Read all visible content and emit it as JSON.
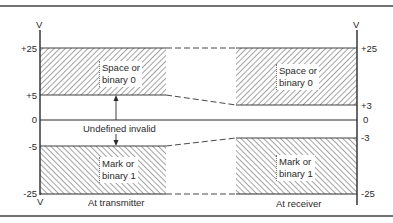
{
  "diagram": {
    "unit_label": "V",
    "transmitter": {
      "caption": "At transmitter",
      "ticks": [
        {
          "label": "+25",
          "value": 25
        },
        {
          "label": "+5",
          "value": 5
        },
        {
          "label": "0",
          "value": 0
        },
        {
          "label": "-5",
          "value": -5
        },
        {
          "label": "-25",
          "value": -25
        }
      ],
      "space_region": {
        "label_line1": "Space or",
        "label_line2": "binary 0",
        "range": [
          5,
          25
        ]
      },
      "mark_region": {
        "label_line1": "Mark or",
        "label_line2": "binary 1",
        "range": [
          -25,
          -5
        ]
      }
    },
    "receiver": {
      "caption": "At receiver",
      "ticks": [
        {
          "label": "+25",
          "value": 25
        },
        {
          "label": "+3",
          "value": 3
        },
        {
          "label": "0",
          "value": 0
        },
        {
          "label": "-3",
          "value": -3
        },
        {
          "label": "-25",
          "value": -25
        }
      ],
      "space_region": {
        "label_line1": "Space or",
        "label_line2": "binary 0",
        "range": [
          3,
          25
        ]
      },
      "mark_region": {
        "label_line1": "Mark or",
        "label_line2": "binary 1",
        "range": [
          -25,
          -3
        ]
      }
    },
    "undefined_label": "Undefined invalid",
    "colors": {
      "line": "#2a2a2a",
      "hatch": "#555555",
      "border": "#444444"
    }
  }
}
